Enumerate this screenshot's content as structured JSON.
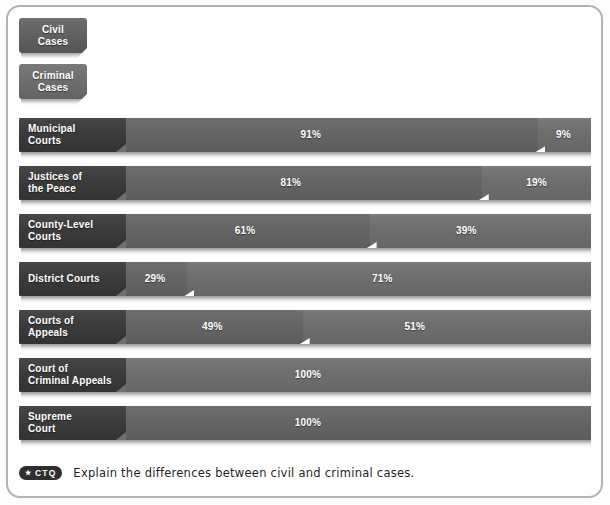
{
  "legend": {
    "items": [
      {
        "label_line1": "Civil",
        "label_line2": "Cases",
        "name": "legend-civil",
        "color": "#5f5f5f"
      },
      {
        "label_line1": "Criminal",
        "label_line2": "Cases",
        "name": "legend-criminal",
        "color": "#6c6c6c"
      }
    ]
  },
  "chart_data": {
    "type": "bar",
    "orientation": "horizontal",
    "stacked": true,
    "title": "",
    "xlabel": "",
    "ylabel": "",
    "xlim": [
      0,
      100
    ],
    "grid": false,
    "legend_position": "top-left",
    "categories": [
      "Municipal Courts",
      "Justices of the Peace",
      "County-Level Courts",
      "District Courts",
      "Courts of Appeals",
      "Court of Criminal Appeals",
      "Supreme Court"
    ],
    "series": [
      {
        "name": "Civil Cases",
        "values": [
          91,
          81,
          61,
          29,
          49,
          0,
          100
        ]
      },
      {
        "name": "Criminal Cases",
        "values": [
          9,
          19,
          39,
          71,
          51,
          100,
          0
        ]
      }
    ]
  },
  "rows": [
    {
      "label_line1": "Municipal",
      "label_line2": "Courts",
      "left_pct": 91,
      "right_pct": 9,
      "left_label": "91%",
      "right_label": "9%",
      "left_label_center": 51,
      "right_label_center": 95.2,
      "split": 90.8
    },
    {
      "label_line1": "Justices of",
      "label_line2": "the Peace",
      "left_pct": 81,
      "right_pct": 19,
      "left_label": "81%",
      "right_label": "19%",
      "left_label_center": 47.5,
      "right_label_center": 90.5,
      "split": 80.9
    },
    {
      "label_line1": "County-Level",
      "label_line2": "Courts",
      "left_pct": 61,
      "right_pct": 39,
      "left_label": "61%",
      "right_label": "39%",
      "left_label_center": 39.5,
      "right_label_center": 78.2,
      "split": 61.3
    },
    {
      "label_line1": "District Courts",
      "label_line2": "",
      "left_pct": 29,
      "right_pct": 71,
      "left_label": "29%",
      "right_label": "71%",
      "left_label_center": 23.8,
      "right_label_center": 63.5,
      "split": 29.4
    },
    {
      "label_line1": "Courts of",
      "label_line2": "Appeals",
      "left_pct": 49,
      "right_pct": 51,
      "left_label": "49%",
      "right_label": "51%",
      "left_label_center": 33.8,
      "right_label_center": 69.2,
      "split": 49.6
    },
    {
      "label_line1": "Court of",
      "label_line2": "Criminal Appeals",
      "left_pct": 0,
      "right_pct": 100,
      "left_label": "",
      "right_label": "100%",
      "left_label_center": 0,
      "right_label_center": 50.5,
      "split": 0
    },
    {
      "label_line1": "Supreme",
      "label_line2": "Court",
      "left_pct": 100,
      "right_pct": 0,
      "left_label": "100%",
      "right_label": "",
      "left_label_center": 50.5,
      "right_label_center": 0,
      "split": 100
    }
  ],
  "footer": {
    "badge_star": "★",
    "badge_text": "CTQ",
    "text": "Explain the differences between civil and criminal cases."
  }
}
